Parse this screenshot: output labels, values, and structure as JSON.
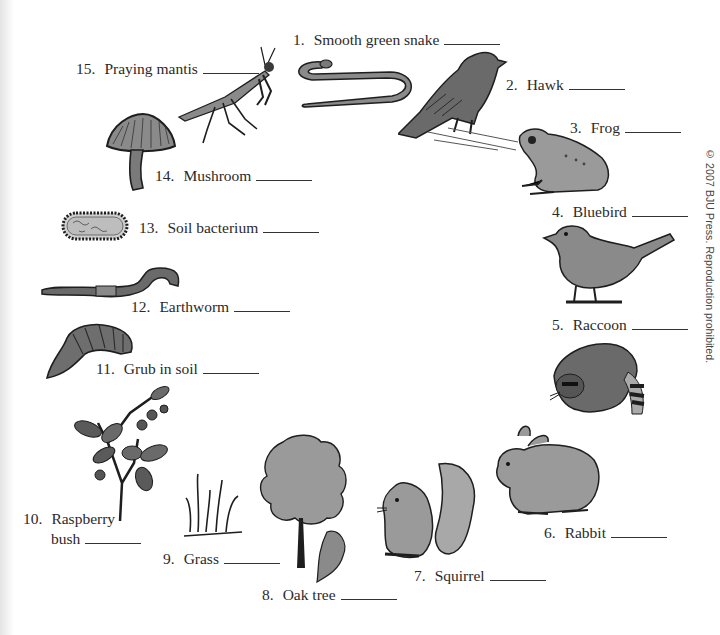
{
  "worksheet": {
    "items": [
      {
        "number": "1.",
        "name": "Smooth green snake"
      },
      {
        "number": "2.",
        "name": "Hawk"
      },
      {
        "number": "3.",
        "name": "Frog"
      },
      {
        "number": "4.",
        "name": "Bluebird"
      },
      {
        "number": "5.",
        "name": "Raccoon"
      },
      {
        "number": "6.",
        "name": "Rabbit"
      },
      {
        "number": "7.",
        "name": "Squirrel"
      },
      {
        "number": "8.",
        "name": "Oak tree"
      },
      {
        "number": "9.",
        "name": "Grass"
      },
      {
        "number": "10.",
        "name": "Raspberry",
        "name_line2": "bush"
      },
      {
        "number": "11.",
        "name": "Grub in soil"
      },
      {
        "number": "12.",
        "name": "Earthworm"
      },
      {
        "number": "13.",
        "name": "Soil bacterium"
      },
      {
        "number": "14.",
        "name": "Mushroom"
      },
      {
        "number": "15.",
        "name": "Praying mantis"
      }
    ],
    "answer_blank": "",
    "copyright": "© 2007 BJU Press. Reproduction prohibited."
  },
  "illustrations": {
    "colors": {
      "ink": "#1e1e1e",
      "fill_dark": "#6a6a6a",
      "fill_mid": "#9a9a9a",
      "fill_light": "#c4c4c4"
    }
  }
}
